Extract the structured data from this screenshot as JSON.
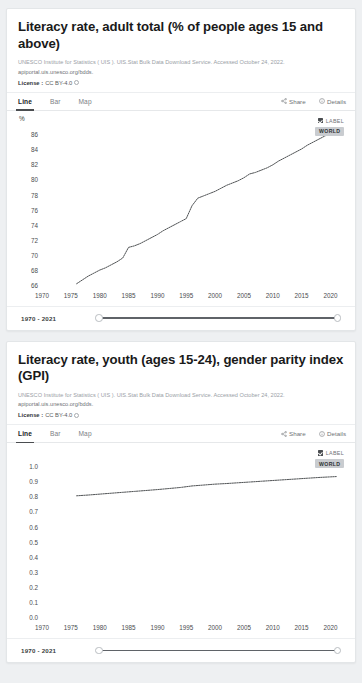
{
  "cards": [
    {
      "title": "Literacy rate, adult total (% of people ages 15 and above)",
      "source_line1": "UNESCO Institute for Statistics ( UIS ). UIS.Stat Bulk Data Download Service. Accessed October 24, 2022.",
      "source_line2": "apiportal.uis.unesco.org/bdds.",
      "license_label": "License :",
      "license_value": "CC BY-4.0",
      "info_icon": "info-circle-icon",
      "tabs": [
        {
          "label": "Line",
          "active": true
        },
        {
          "label": "Bar",
          "active": false
        },
        {
          "label": "Map",
          "active": false
        }
      ],
      "actions": [
        {
          "label": "Share",
          "icon": "share-icon"
        },
        {
          "label": "Details",
          "icon": "info-circle-icon"
        }
      ],
      "legend": {
        "checkbox_label": "LABEL",
        "series_tag": "WORLD",
        "checked": true
      },
      "slider": {
        "range_text": "1970 - 2021",
        "min_handle": "slider-handle-left",
        "max_handle": "slider-handle-right"
      },
      "chart_data": {
        "type": "line",
        "title": "Literacy rate, adult total (% of people ages 15 and above)",
        "xlabel": "",
        "ylabel": "%",
        "unit": "%",
        "xlim": [
          1970,
          2022
        ],
        "ylim": [
          66,
          87
        ],
        "yticks": [
          66,
          68,
          70,
          72,
          74,
          76,
          78,
          80,
          82,
          84,
          86
        ],
        "xticks": [
          1970,
          1975,
          1980,
          1985,
          1990,
          1995,
          2000,
          2005,
          2010,
          2015,
          2020
        ],
        "grid": false,
        "legend": "WORLD",
        "series": [
          {
            "name": "WORLD",
            "x": [
              1976,
              1977,
              1978,
              1979,
              1980,
              1981,
              1982,
              1983,
              1984,
              1985,
              1986,
              1987,
              1988,
              1989,
              1990,
              1991,
              1992,
              1993,
              1994,
              1995,
              1996,
              1997,
              1998,
              1999,
              2000,
              2001,
              2002,
              2003,
              2004,
              2005,
              2006,
              2007,
              2008,
              2009,
              2010,
              2011,
              2012,
              2013,
              2014,
              2015,
              2016,
              2017,
              2018,
              2019,
              2020,
              2021
            ],
            "values": [
              66.3,
              66.8,
              67.3,
              67.7,
              68.1,
              68.4,
              68.8,
              69.2,
              69.7,
              71.1,
              71.3,
              71.6,
              72.0,
              72.4,
              72.8,
              73.3,
              73.7,
              74.1,
              74.5,
              74.9,
              76.6,
              77.6,
              77.9,
              78.2,
              78.5,
              78.9,
              79.3,
              79.6,
              79.9,
              80.3,
              80.8,
              81.0,
              81.3,
              81.6,
              82.0,
              82.5,
              82.9,
              83.3,
              83.7,
              84.1,
              84.6,
              85.0,
              85.4,
              85.8,
              86.2,
              86.5
            ]
          }
        ]
      }
    },
    {
      "title": "Literacy rate, youth (ages 15-24), gender parity index (GPI)",
      "source_line1": "UNESCO Institute for Statistics ( UIS ). UIS.Stat Bulk Data Download Service. Accessed October 24, 2022.",
      "source_line2": "apiportal.uis.unesco.org/bdds.",
      "license_label": "License :",
      "license_value": "CC BY-4.0",
      "info_icon": "info-circle-icon",
      "tabs": [
        {
          "label": "Line",
          "active": true
        },
        {
          "label": "Bar",
          "active": false
        },
        {
          "label": "Map",
          "active": false
        }
      ],
      "actions": [
        {
          "label": "Share",
          "icon": "share-icon"
        },
        {
          "label": "Details",
          "icon": "info-circle-icon"
        }
      ],
      "legend": {
        "checkbox_label": "LABEL",
        "series_tag": "WORLD",
        "checked": true
      },
      "slider": {
        "range_text": "1970 - 2021",
        "min_handle": "slider-handle-left",
        "max_handle": "slider-handle-right"
      },
      "chart_data": {
        "type": "line",
        "title": "Literacy rate, youth (ages 15-24), gender parity index (GPI)",
        "xlabel": "",
        "ylabel": "",
        "unit": "",
        "xlim": [
          1970,
          2022
        ],
        "ylim": [
          0.0,
          1.05
        ],
        "yticks": [
          0.0,
          0.1,
          0.2,
          0.3,
          0.4,
          0.5,
          0.6,
          0.7,
          0.8,
          0.9,
          1.0
        ],
        "xticks": [
          1970,
          1975,
          1980,
          1985,
          1990,
          1995,
          2000,
          2005,
          2010,
          2015,
          2020
        ],
        "grid": false,
        "legend": "WORLD",
        "series": [
          {
            "name": "WORLD",
            "x": [
              1976,
              1978,
              1980,
              1982,
              1984,
              1986,
              1988,
              1990,
              1992,
              1994,
              1996,
              1998,
              2000,
              2002,
              2004,
              2006,
              2008,
              2010,
              2012,
              2014,
              2016,
              2018,
              2020,
              2021
            ],
            "values": [
              0.807,
              0.812,
              0.818,
              0.824,
              0.83,
              0.836,
              0.842,
              0.848,
              0.855,
              0.862,
              0.872,
              0.878,
              0.884,
              0.888,
              0.893,
              0.898,
              0.903,
              0.908,
              0.913,
              0.918,
              0.923,
              0.928,
              0.932,
              0.934
            ]
          }
        ]
      }
    }
  ]
}
